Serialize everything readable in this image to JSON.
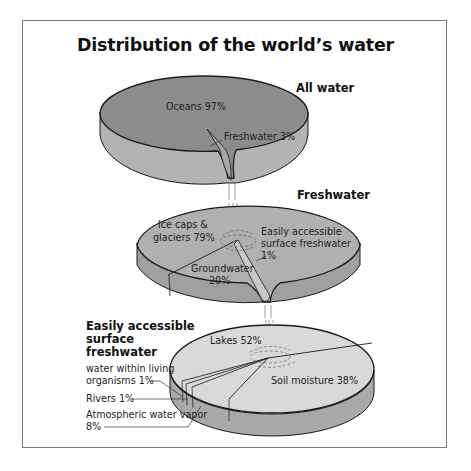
{
  "title": "Distribution of the world’s water",
  "colors": {
    "all_water_top": "#8c8c8c",
    "all_water_side": "#b3b3b3",
    "freshwater_top": "#b0b0b0",
    "freshwater_side": "#a0a0a0",
    "surface_top": "#d9d9d9",
    "surface_side": "#a9a9a9",
    "outline": "#1a1a1a",
    "frame": "#7a7a7a"
  },
  "diagrams": [
    {
      "heading": "All water",
      "segments": [
        {
          "label": "Oceans 97%",
          "name": "Oceans",
          "percent": 97
        },
        {
          "label": "Freshwater 3%",
          "name": "Freshwater",
          "percent": 3
        }
      ]
    },
    {
      "heading": "Freshwater",
      "segments": [
        {
          "label_lines": [
            "Ice caps &",
            "glaciers 79%"
          ],
          "name": "Ice caps & glaciers",
          "percent": 79
        },
        {
          "label_lines": [
            "Groundwater",
            "20%"
          ],
          "name": "Groundwater",
          "percent": 20
        },
        {
          "label_lines": [
            "Easily accessible",
            "surface freshwater",
            "1%"
          ],
          "name": "Easily accessible surface freshwater",
          "percent": 1
        }
      ]
    },
    {
      "heading_lines": [
        "Easily accessible",
        "surface",
        "freshwater"
      ],
      "segments": [
        {
          "label": "Lakes 52%",
          "name": "Lakes",
          "percent": 52
        },
        {
          "label": "Soil moisture 38%",
          "name": "Soil moisture",
          "percent": 38
        },
        {
          "label_lines": [
            "water within living",
            "organisms 1%"
          ],
          "name": "Water within living organisms",
          "percent": 1
        },
        {
          "label": "Rivers 1%",
          "name": "Rivers",
          "percent": 1
        },
        {
          "label_lines": [
            "Atmospheric water vapor",
            "8%"
          ],
          "name": "Atmospheric water vapor",
          "percent": 8
        }
      ]
    }
  ]
}
